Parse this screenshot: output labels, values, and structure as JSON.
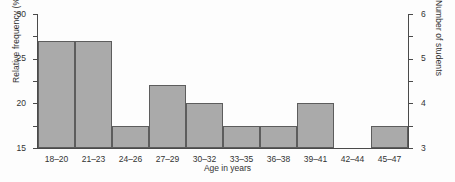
{
  "chart_data": {
    "type": "bar",
    "title": "",
    "xlabel": "Age in years",
    "ylabel": "Relative frequency (%)",
    "ylabel_secondary": "Number of students",
    "categories": [
      "18–20",
      "21–23",
      "24–26",
      "27–29",
      "30–32",
      "33–35",
      "36–38",
      "39–41",
      "42–44",
      "45–47"
    ],
    "values": [
      24,
      24,
      5,
      14,
      10,
      5,
      5,
      10,
      0,
      5
    ],
    "series": [
      {
        "name": "Relative frequency (%)",
        "values": [
          24,
          24,
          5,
          14,
          10,
          5,
          5,
          10,
          0,
          5
        ]
      },
      {
        "name": "Number of students",
        "values": [
          5,
          5,
          1,
          3,
          2,
          1,
          1,
          2,
          0,
          1
        ]
      }
    ],
    "ylim": [
      0,
      30
    ],
    "yticks": [
      0,
      5,
      10,
      15,
      20,
      25,
      30
    ],
    "ytick_labels": [
      "0",
      "5",
      "10",
      "15",
      "20",
      "25",
      "30"
    ],
    "ylim_secondary": [
      0,
      6
    ],
    "yticks_secondary": [
      0,
      1,
      2,
      3,
      4,
      5,
      6
    ],
    "ytick_labels_secondary": [
      "0",
      "1",
      "2",
      "3",
      "4",
      "5",
      "6"
    ],
    "grid": false,
    "legend": "none",
    "bar_color": "#aaaaaa",
    "bar_border_color": "#5d5d5d",
    "axis_color": "#4a4a4a",
    "background_color": "#fdfdfd"
  }
}
